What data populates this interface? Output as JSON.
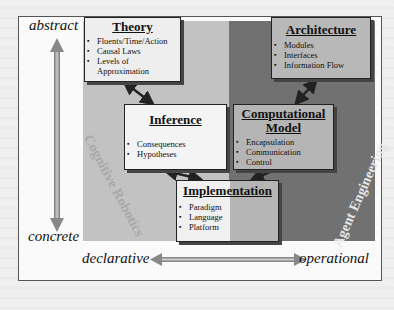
{
  "axes": {
    "top": "abstract",
    "bottom": "concrete",
    "left": "declarative",
    "right": "operational"
  },
  "regions": {
    "left": "Cognitive Robotics",
    "right": "Agent Engineering"
  },
  "boxes": {
    "theory": {
      "title": "Theory",
      "items": [
        "Fluents/Time/Action",
        "Causal Laws",
        "Levels of",
        "Approximation"
      ]
    },
    "architecture": {
      "title": "Architecture",
      "items": [
        "Modules",
        "Interfaces",
        "Information Flow"
      ]
    },
    "inference": {
      "title": "Inference",
      "items": [
        "Consequences",
        "Hypotheses"
      ]
    },
    "computational_model": {
      "title_line1": "Computational",
      "title_line2": "Model",
      "items": [
        "Encapsulation",
        "Communication",
        "Control"
      ]
    },
    "implementation": {
      "title": "Implementation",
      "items": [
        "Paradigm",
        "Language",
        "Platform"
      ]
    }
  },
  "colors": {
    "frame_bg": "#fafafa",
    "light_panel": "#c2c2c2",
    "dark_panel": "#717171",
    "arrow": "#9a9a9a",
    "connector": "#222222"
  }
}
